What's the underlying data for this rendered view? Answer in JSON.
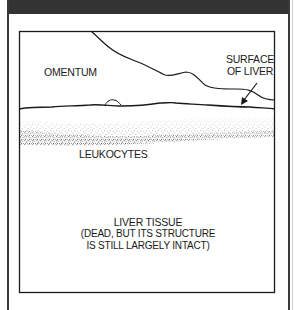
{
  "diagram": {
    "labels": {
      "omentum": "OMENTUM",
      "surface_line1": "SURFACE",
      "surface_line2": "OF LIVER",
      "leukocytes": "LEUKOCYTES",
      "liver_tissue_title": "LIVER TISSUE",
      "liver_tissue_note_line1": "(DEAD, BUT ITS STRUCTURE",
      "liver_tissue_note_line2": "IS STILL LARGELY INTACT)"
    },
    "regions": [
      "omentum",
      "surface-of-liver",
      "leukocytes",
      "liver-tissue"
    ],
    "colors": {
      "ink": "#1a1a1a",
      "header_bar": "#333333",
      "background": "#ffffff"
    }
  }
}
